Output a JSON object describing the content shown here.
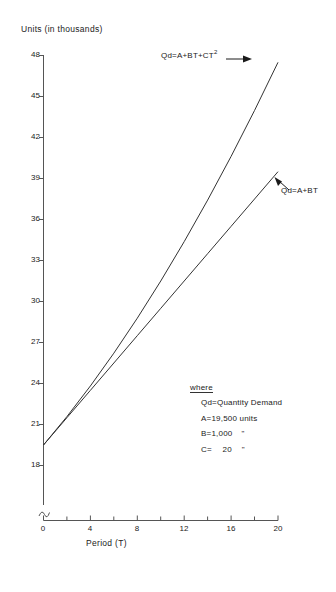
{
  "chart_data": {
    "type": "line",
    "title": "",
    "xlabel": "Period (T)",
    "ylabel": "Units (in thousands)",
    "xlim": [
      0,
      20
    ],
    "ylim": [
      18,
      48
    ],
    "xticks": [
      0,
      4,
      8,
      12,
      16,
      20
    ],
    "yticks": [
      18,
      21,
      24,
      27,
      30,
      33,
      36,
      39,
      42,
      45,
      48
    ],
    "y_axis_break": true,
    "grid": false,
    "legend_position": "inside-lower-right",
    "series": [
      {
        "name": "Qd = A+BT+CT2",
        "label": "Qd = A+BT+CT²",
        "equation": "Qd = A+BT+CT^2",
        "x": [
          0,
          2,
          4,
          6,
          8,
          10,
          12,
          14,
          16,
          18,
          20
        ],
        "values": [
          19.5,
          21.58,
          23.82,
          26.22,
          28.78,
          31.5,
          34.38,
          37.42,
          40.62,
          43.98,
          47.5
        ]
      },
      {
        "name": "Qd = A+BT",
        "label": "Qd = A+BT",
        "equation": "Qd = A+BT",
        "x": [
          0,
          2,
          4,
          6,
          8,
          10,
          12,
          14,
          16,
          18,
          20
        ],
        "values": [
          19.5,
          21.5,
          23.5,
          25.5,
          27.5,
          29.5,
          31.5,
          33.5,
          35.5,
          37.5,
          39.5
        ]
      }
    ],
    "annotations": [
      {
        "name": "quad-curve-label",
        "text": "Qd = A+BT+CT²",
        "arrow": "right"
      },
      {
        "name": "linear-curve-label",
        "text": "Qd = A+BT",
        "arrow": "up-left"
      }
    ]
  },
  "axes": {
    "y_title": "Units (in thousands)",
    "x_title": "Period (T)",
    "y_tick_labels": [
      "48",
      "45",
      "42",
      "39",
      "36",
      "33",
      "30",
      "27",
      "24",
      "21",
      "18"
    ],
    "x_tick_labels": [
      "0",
      "4",
      "8",
      "12",
      "16",
      "20"
    ]
  },
  "curve_labels": {
    "quadratic_prefix": "Qd",
    "quadratic_eq": "=A+BT+CT",
    "quadratic_exp": "2",
    "linear": "Qd=A+BT"
  },
  "legend": {
    "heading": "where",
    "entries": [
      {
        "symbol": "Qd",
        "sep": "=",
        "value": "Quantity Demand",
        "unit": ""
      },
      {
        "symbol": "A",
        "sep": "=",
        "value": "19,500",
        "unit": "units"
      },
      {
        "symbol": "B",
        "sep": "=",
        "value": "1,000",
        "unit": "\""
      },
      {
        "symbol": "C",
        "sep": "=",
        "value": "20",
        "unit": "\""
      }
    ]
  },
  "colors": {
    "ink": "#1a1a1a",
    "axis": "#555555",
    "curve": "#333333",
    "background": "#ffffff"
  }
}
